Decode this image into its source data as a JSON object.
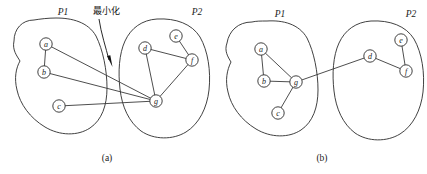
{
  "figure": {
    "width": 427,
    "height": 174,
    "background_color": "#ffffff",
    "stroke_color": "#2b2b2b",
    "node_fill_color": "#ffffff",
    "panels": [
      {
        "id": "a",
        "caption": "(a)",
        "caption_pos": {
          "x": 107,
          "y": 158
        },
        "annotation": {
          "text": "最小化",
          "pos": {
            "x": 106,
            "y": 11
          },
          "arrow_from": {
            "x": 99,
            "y": 19
          },
          "arrow_to": {
            "x": 111,
            "y": 66
          }
        },
        "partitions": [
          {
            "name": "P1",
            "label_pos": {
              "x": 63,
              "y": 12
            },
            "outline": "M 34,20 C 22,20 14,29 14,41 C 12,50 17,56 20,61 C 16,68 14,78 17,90 C 20,104 30,118 45,127 C 60,136 78,136 90,128 C 102,120 107,105 107,88 C 107,70 103,50 96,36 C 88,22 72,18 56,18 C 48,18 40,19 34,20 Z"
          },
          {
            "name": "P2",
            "label_pos": {
              "x": 197,
              "y": 12
            },
            "outline": "M 157,19 C 142,20 131,28 125,41 C 119,54 118,72 120,89 C 122,107 129,122 141,131 C 154,140 173,140 186,132 C 199,124 207,108 209,90 C 211,71 208,51 200,37 C 192,24 176,18 157,19 Z"
          }
        ],
        "nodes": [
          {
            "id": "a",
            "label": "a",
            "x": 46,
            "y": 44,
            "r": 6.2,
            "partition": "P1"
          },
          {
            "id": "b",
            "label": "b",
            "x": 44,
            "y": 72,
            "r": 6.2,
            "partition": "P1"
          },
          {
            "id": "c",
            "label": "c",
            "x": 59,
            "y": 106,
            "r": 6.2,
            "partition": "P1"
          },
          {
            "id": "d",
            "label": "d",
            "x": 145,
            "y": 48,
            "r": 6.2,
            "partition": "P2"
          },
          {
            "id": "e",
            "label": "e",
            "x": 176,
            "y": 36,
            "r": 6.2,
            "partition": "P2"
          },
          {
            "id": "f",
            "label": "f",
            "x": 192,
            "y": 60,
            "r": 6.2,
            "partition": "P2"
          },
          {
            "id": "g",
            "label": "g",
            "x": 156,
            "y": 101,
            "r": 6.2,
            "partition": "P2"
          }
        ],
        "edges": [
          {
            "from": "a",
            "to": "b",
            "cut": false
          },
          {
            "from": "a",
            "to": "g",
            "cut": true
          },
          {
            "from": "b",
            "to": "g",
            "cut": true
          },
          {
            "from": "c",
            "to": "g",
            "cut": true
          },
          {
            "from": "d",
            "to": "f",
            "cut": false
          },
          {
            "from": "d",
            "to": "g",
            "cut": false
          },
          {
            "from": "e",
            "to": "f",
            "cut": false
          },
          {
            "from": "f",
            "to": "g",
            "cut": false
          }
        ],
        "cut_edge_count": 3
      },
      {
        "id": "b",
        "caption": "(b)",
        "caption_pos": {
          "x": 322,
          "y": 158
        },
        "annotation": null,
        "partitions": [
          {
            "name": "P1",
            "label_pos": {
              "x": 280,
              "y": 14
            },
            "outline": "M 252,22 C 238,22 229,31 227,43 C 224,51 228,57 231,62 C 227,70 225,80 228,92 C 231,106 241,120 256,129 C 271,138 289,138 301,130 C 313,122 318,107 318,90 C 318,72 314,52 307,38 C 299,24 283,20 267,21 C 261,21 256,21 252,22 Z"
          },
          {
            "name": "P2",
            "label_pos": {
              "x": 411,
              "y": 14
            },
            "outline": "M 371,21 C 356,22 345,30 339,43 C 333,56 332,74 334,91 C 336,109 343,124 355,133 C 368,142 387,142 400,134 C 413,126 421,110 423,92 C 425,73 422,53 414,39 C 406,26 390,20 371,21 Z"
          }
        ],
        "nodes": [
          {
            "id": "a",
            "label": "a",
            "x": 261,
            "y": 49,
            "r": 6.2,
            "partition": "P1"
          },
          {
            "id": "b",
            "label": "b",
            "x": 264,
            "y": 81,
            "r": 6.2,
            "partition": "P1"
          },
          {
            "id": "c",
            "label": "c",
            "x": 278,
            "y": 113,
            "r": 6.2,
            "partition": "P1"
          },
          {
            "id": "g",
            "label": "g",
            "x": 296,
            "y": 82,
            "r": 6.2,
            "partition": "P1"
          },
          {
            "id": "d",
            "label": "d",
            "x": 370,
            "y": 56,
            "r": 6.2,
            "partition": "P2"
          },
          {
            "id": "e",
            "label": "e",
            "x": 401,
            "y": 40,
            "r": 6.2,
            "partition": "P2"
          },
          {
            "id": "f",
            "label": "f",
            "x": 406,
            "y": 71,
            "r": 6.2,
            "partition": "P2"
          }
        ],
        "edges": [
          {
            "from": "a",
            "to": "b",
            "cut": false
          },
          {
            "from": "a",
            "to": "g",
            "cut": false
          },
          {
            "from": "b",
            "to": "g",
            "cut": false
          },
          {
            "from": "c",
            "to": "g",
            "cut": false
          },
          {
            "from": "g",
            "to": "d",
            "cut": true
          },
          {
            "from": "d",
            "to": "f",
            "cut": false
          },
          {
            "from": "e",
            "to": "f",
            "cut": false
          }
        ],
        "cut_edge_count": 1
      }
    ]
  }
}
